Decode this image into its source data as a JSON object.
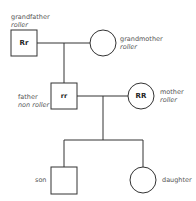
{
  "diagram": {
    "type": "pedigree",
    "stroke_color": "#333333",
    "individuals": [
      {
        "id": "grandfather",
        "role": "grandfather",
        "status": "roller",
        "sex": "male",
        "genotype": "Rr"
      },
      {
        "id": "grandmother",
        "role": "grandmother",
        "status": "roller",
        "sex": "female",
        "genotype": ""
      },
      {
        "id": "father",
        "role": "father",
        "status": "non roller",
        "sex": "male",
        "genotype": "rr"
      },
      {
        "id": "mother",
        "role": "mother",
        "status": "roller",
        "sex": "female",
        "genotype": "RR"
      },
      {
        "id": "son",
        "role": "son",
        "status": "",
        "sex": "male",
        "genotype": ""
      },
      {
        "id": "daughter",
        "role": "daughter",
        "status": "",
        "sex": "female",
        "genotype": ""
      }
    ]
  },
  "labels": {
    "grandfather_role": "grandfather",
    "grandfather_status": "roller",
    "grandfather_genotype": "Rr",
    "grandmother_role": "grandmother",
    "grandmother_status": "roller",
    "father_role": "father",
    "father_status": "non roller",
    "father_genotype": "rr",
    "mother_role": "mother",
    "mother_status": "roller",
    "mother_genotype": "RR",
    "son_role": "son",
    "daughter_role": "daughter"
  }
}
